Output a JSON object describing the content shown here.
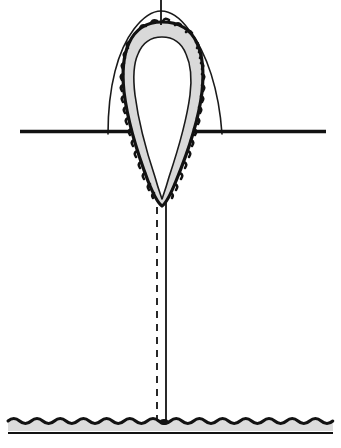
{
  "figure": {
    "canvas": {
      "width": 341,
      "height": 448,
      "background": "#ffffff"
    },
    "title": "",
    "caption": "",
    "labels": [],
    "colors": {
      "ink": "#121212",
      "outline_thin": "#1a1a1a",
      "band_fill": "#d9d9d9",
      "substrate_fill": "#dcdcdc",
      "paper": "#ffffff"
    },
    "line_weights": {
      "outer_arch": 1.6,
      "baseline": 3.4,
      "crenulate_outer": 3.2,
      "inner_outline": 1.6,
      "axis_solid": 1.8,
      "axis_dashed": 1.8,
      "substrate_wave": 3.0,
      "substrate_base": 2.2
    }
  },
  "elements": {
    "outer_arch": {
      "name": "outer-arch-outline",
      "description": "thin parabolic arch rising above the baseline",
      "left_foot_x": 108,
      "right_foot_x": 225,
      "apex_y": 12,
      "foot_y": 131
    },
    "baseline": {
      "name": "ground-baseline",
      "description": "heavy horizontal reference line",
      "x_start": 20,
      "x_end": 326,
      "y": 131
    },
    "teardrop": {
      "name": "crenulate-teardrop-body",
      "description": "inverted teardrop with scalloped outer margin and pale band fill",
      "top_y": 22,
      "tip_y": 206,
      "tip_x": 162,
      "widest_y": 95,
      "left_x": 124,
      "right_x": 204,
      "crenulation_count": 34,
      "crenulation_depth": 2.6
    },
    "inner_cavity": {
      "name": "inner-cavity-outline",
      "description": "thin inner contour enclosing the white lumen",
      "top_y": 37,
      "tip_y": 199
    },
    "top_stem": {
      "name": "top-stem-line",
      "description": "short vertical line above the teardrop apex",
      "x": 161,
      "y_start": 0,
      "y_end": 25
    },
    "axis_solid": {
      "name": "axis-solid-line",
      "description": "solid vertical line descending from the tip to the substrate",
      "x": 166,
      "y_start": 206,
      "y_end": 423
    },
    "axis_dashed": {
      "name": "axis-dashed-line",
      "description": "dashed vertical line parallel to the solid axis",
      "x": 157,
      "y_start": 207,
      "y_end": 422,
      "dash": "7 6"
    },
    "substrate": {
      "name": "substrate-band",
      "description": "wavy scalloped horizontal band at the bottom of the figure",
      "x_start": 8,
      "x_end": 333,
      "wave_y": 421,
      "wave_amplitude": 4,
      "wave_count": 28,
      "band_bottom_y": 431,
      "base_line_y": 433
    },
    "junction_dot": {
      "name": "axis-substrate-junction",
      "description": "small dark node where the vertical axis meets the substrate",
      "x": 164,
      "y": 422,
      "rx": 4.5,
      "ry": 3
    }
  },
  "chart_data": {
    "type": "diagram",
    "title": "",
    "xlabel": "",
    "ylabel": ""
  }
}
